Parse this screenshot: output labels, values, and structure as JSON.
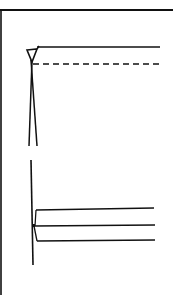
{
  "diagram": {
    "colors": {
      "ink": "#111111",
      "background": "#ffffff"
    },
    "figures": [
      {
        "name": "upper-detail",
        "elements": [
          "solid-horizontal-line",
          "dashed-horizontal-line",
          "triangle-marker",
          "converging-vertical-lines"
        ]
      },
      {
        "name": "lower-detail",
        "elements": [
          "vertical-line",
          "three-horizontal-lines",
          "connector-bracket"
        ]
      }
    ]
  }
}
